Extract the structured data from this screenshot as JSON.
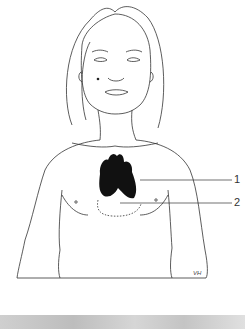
{
  "figure": {
    "labels": [
      {
        "id": "1",
        "text": "1",
        "target": "thymus (dark mass)"
      },
      {
        "id": "2",
        "text": "2",
        "target": "heart outline (dotted)"
      }
    ],
    "signature": "VH",
    "colors": {
      "line": "#333333",
      "organ": "#111111",
      "background": "#ffffff",
      "strip": "#c8c8c8"
    }
  }
}
